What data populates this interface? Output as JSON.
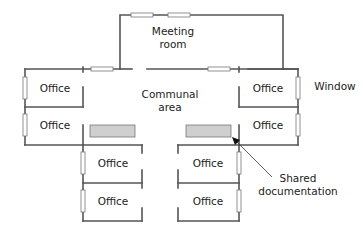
{
  "diagram": {
    "type": "office floor plan",
    "rooms": {
      "meeting_room": {
        "label_line1": "Meeting",
        "label_line2": "room"
      },
      "communal_area": {
        "label_line1": "Communal",
        "label_line2": "area"
      },
      "offices": [
        {
          "id": "office-left-upper",
          "label": "Office"
        },
        {
          "id": "office-left-lower",
          "label": "Office"
        },
        {
          "id": "office-right-upper",
          "label": "Office"
        },
        {
          "id": "office-right-lower",
          "label": "Office"
        },
        {
          "id": "office-bottom-left-1",
          "label": "Office"
        },
        {
          "id": "office-bottom-left-2",
          "label": "Office"
        },
        {
          "id": "office-bottom-right-1",
          "label": "Office"
        },
        {
          "id": "office-bottom-right-2",
          "label": "Office"
        }
      ]
    },
    "annotations": {
      "window": "Window",
      "shared_documentation_line1": "Shared",
      "shared_documentation_line2": "documentation"
    },
    "colors": {
      "wall": "#555555",
      "shelf_fill": "#cfcfcf",
      "window_outline": "#777777",
      "text": "#222222"
    }
  }
}
